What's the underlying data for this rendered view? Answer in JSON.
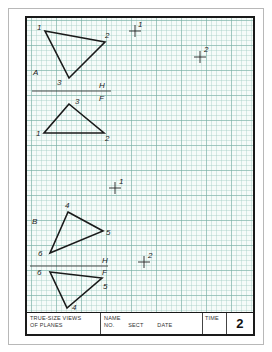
{
  "worksheet": {
    "title_block": {
      "title_line1": "TRUE-SIZE VIEWS",
      "title_line2": "OF PLANES",
      "name_label": "NAME",
      "no_label": "NO.",
      "sect_label": "SECT",
      "date_label": "DATE",
      "time_label": "TIME",
      "sheet_number": "2"
    },
    "problem_a": {
      "label": "A",
      "fold_line": {
        "upper_label": "H",
        "lower_label": "F"
      },
      "top_view_points": [
        {
          "id": "1",
          "x": 45,
          "y": 31
        },
        {
          "id": "2",
          "x": 105,
          "y": 42
        },
        {
          "id": "3",
          "x": 69,
          "y": 78
        }
      ],
      "front_view_points": [
        {
          "id": "3",
          "x": 69,
          "y": 104
        },
        {
          "id": "1",
          "x": 44,
          "y": 133
        },
        {
          "id": "2",
          "x": 104,
          "y": 133
        }
      ],
      "crosshairs": [
        {
          "id": "1",
          "x": 135,
          "y": 31
        },
        {
          "id": "2",
          "x": 200,
          "y": 57
        }
      ]
    },
    "problem_b": {
      "label": "B",
      "fold_line": {
        "upper_label": "H",
        "lower_label": "F"
      },
      "top_view_points": [
        {
          "id": "4",
          "x": 68,
          "y": 212
        },
        {
          "id": "5",
          "x": 103,
          "y": 231
        },
        {
          "id": "6",
          "x": 50,
          "y": 253
        }
      ],
      "front_view_points": [
        {
          "id": "6",
          "x": 50,
          "y": 272
        },
        {
          "id": "5",
          "x": 102,
          "y": 278
        },
        {
          "id": "4",
          "x": 67,
          "y": 308
        }
      ],
      "crosshairs": [
        {
          "id": "1",
          "x": 115,
          "y": 188
        },
        {
          "id": "2",
          "x": 144,
          "y": 262
        }
      ]
    },
    "colors": {
      "grid_minor": "#aad2c8",
      "grid_major": "#78afa5",
      "ink": "#1a1a1a",
      "paper": "#f6fbf9"
    }
  }
}
